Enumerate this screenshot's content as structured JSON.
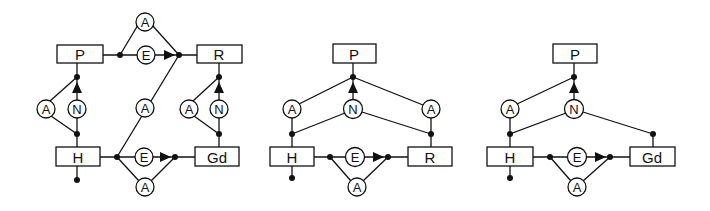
{
  "diagrams": [
    {
      "id": "left",
      "entities": {
        "p": "P",
        "r": "R",
        "h": "H",
        "gd": "Gd"
      },
      "nodes": {
        "top_a": "A",
        "top_e": "E",
        "p_a": "A",
        "p_n": "N",
        "mid_a": "A",
        "r_a": "A",
        "r_n": "N",
        "bot_e": "E",
        "bot_a": "A"
      }
    },
    {
      "id": "middle",
      "entities": {
        "p": "P",
        "h": "H",
        "r": "R"
      },
      "nodes": {
        "left_a": "A",
        "n": "N",
        "right_a": "A",
        "bot_e": "E",
        "bot_a": "A"
      }
    },
    {
      "id": "right",
      "entities": {
        "p": "P",
        "h": "H",
        "gd": "Gd"
      },
      "nodes": {
        "left_a": "A",
        "n": "N",
        "bot_e": "E",
        "bot_a": "A"
      }
    }
  ],
  "colors": {
    "stroke": "#111111",
    "background": "#ffffff"
  }
}
